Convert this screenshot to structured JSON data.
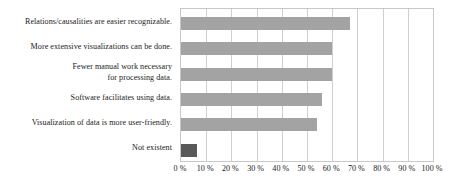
{
  "chart_data": {
    "type": "bar",
    "orientation": "horizontal",
    "title": "",
    "subtitle": "",
    "xlabel": "",
    "ylabel": "",
    "xlim": [
      0,
      100
    ],
    "grid": true,
    "legend": "none",
    "categories": [
      "Relations/causalities are easier recognizable.",
      "More extensive visualizations can be done.",
      "Fewer manual work necessary\nfor processing data.",
      "Software facilitates using data.",
      "Visualization of data is more user-friendly.",
      "Not existent"
    ],
    "values": [
      67,
      60,
      60,
      56,
      54,
      6.5
    ],
    "bar_colors": [
      "#a3a3a3",
      "#a3a3a3",
      "#a3a3a3",
      "#a3a3a3",
      "#a3a3a3",
      "#595959"
    ],
    "tick_labels": [
      "0 %",
      "10 %",
      "20 %",
      "30 %",
      "40 %",
      "50 %",
      "60 %",
      "70 %",
      "80 %",
      "90 %",
      "100 %"
    ],
    "tick_values": [
      0,
      10,
      20,
      30,
      40,
      50,
      60,
      70,
      80,
      90,
      100
    ]
  },
  "colors": {
    "bar_primary": "#a3a3a3",
    "bar_highlight": "#595959",
    "gridline": "#cfcfcf",
    "axis_border": "#c8c8c8",
    "text": "#1a1a1a",
    "background": "#ffffff"
  }
}
